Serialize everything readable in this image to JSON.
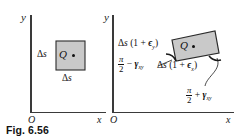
{
  "figure": {
    "caption": "Fig. 6.56",
    "colors": {
      "element_fill": "#c9c9c9",
      "element_stroke": "#2b2b2b",
      "axis": "#3a3a3a",
      "text": "#111111",
      "background": "#ffffff"
    }
  },
  "panels": {
    "undeformed": {
      "name": "undeformed-element",
      "axes": {
        "y_label": "y",
        "x_label": "x",
        "origin_label": "O"
      },
      "point_label": "Q",
      "side_label_left": {
        "delta": "Δ",
        "s": "s"
      },
      "side_label_bottom": {
        "delta": "Δ",
        "s": "s"
      }
    },
    "deformed": {
      "name": "deformed-element",
      "axes": {
        "y_label": "y",
        "x_label": "x",
        "origin_label": "O"
      },
      "point_label": "Q",
      "side_label_left": {
        "delta": "Δ",
        "s": "s",
        "open_paren": "(1 + ",
        "epsilon": "ϵ",
        "epsilon_sub": "y",
        "close_paren": ")"
      },
      "side_label_bottom": {
        "delta": "Δ",
        "s": "s",
        "open_paren": "(1 + ",
        "epsilon": "ϵ",
        "epsilon_sub": "x",
        "close_paren": ")"
      },
      "angle_label_left": {
        "pi": "π",
        "two": "2",
        "operator": "−",
        "gamma": "γ",
        "gamma_sub": "xy"
      },
      "angle_label_right": {
        "pi": "π",
        "two": "2",
        "operator": "+",
        "gamma": "γ",
        "gamma_sub": "xy"
      }
    }
  }
}
